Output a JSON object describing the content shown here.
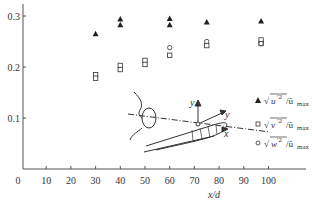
{
  "chart_data": {
    "type": "scatter",
    "title": "",
    "xlabel": "x/d",
    "ylabel": "",
    "xlim": [
      0,
      110
    ],
    "ylim": [
      0,
      0.32
    ],
    "grid": false,
    "legend_position": "right-inside",
    "x_ticks": [
      "0",
      "10",
      "20",
      "30",
      "40",
      "50",
      "60",
      "70",
      "80",
      "90",
      "100"
    ],
    "y_ticks": [
      "0.1",
      "0.2",
      "0.3"
    ],
    "series": [
      {
        "name": "sqrt(u'^2)/u_max",
        "marker": "filled-triangle",
        "points": [
          {
            "x": 30,
            "y": 0.265
          },
          {
            "x": 40,
            "y": 0.294
          },
          {
            "x": 40,
            "y": 0.283
          },
          {
            "x": 60,
            "y": 0.295
          },
          {
            "x": 60,
            "y": 0.283
          },
          {
            "x": 75,
            "y": 0.288
          },
          {
            "x": 97,
            "y": 0.29
          }
        ]
      },
      {
        "name": "sqrt(v'^2)/u_max",
        "marker": "open-square",
        "points": [
          {
            "x": 30,
            "y": 0.185
          },
          {
            "x": 30,
            "y": 0.178
          },
          {
            "x": 40,
            "y": 0.203
          },
          {
            "x": 40,
            "y": 0.195
          },
          {
            "x": 50,
            "y": 0.213
          },
          {
            "x": 50,
            "y": 0.205
          },
          {
            "x": 60,
            "y": 0.223
          },
          {
            "x": 75,
            "y": 0.242
          },
          {
            "x": 97,
            "y": 0.253
          },
          {
            "x": 97,
            "y": 0.246
          }
        ]
      },
      {
        "name": "sqrt(w'^2)/u_max",
        "marker": "open-circle",
        "points": [
          {
            "x": 60,
            "y": 0.238
          },
          {
            "x": 75,
            "y": 0.25
          },
          {
            "x": 97,
            "y": 0.246
          }
        ]
      }
    ],
    "annotations": [
      "inset diagram: jet nozzle with coordinate axes x, y, and velocity profile"
    ]
  },
  "axes": {
    "origin_label": "0",
    "x_tick_labels": [
      "10",
      "20",
      "30",
      "40",
      "50",
      "60",
      "70",
      "80",
      "90",
      "100"
    ],
    "y_tick_labels": [
      "0.1",
      "0.2",
      "0.3"
    ],
    "x_title": "x/d"
  },
  "legend": {
    "items": [
      {
        "symbol": "▲",
        "var": "u",
        "label_suffix": "/ū",
        "sub": "max"
      },
      {
        "symbol": "□",
        "var": "v",
        "label_suffix": "/ū",
        "sub": "max"
      },
      {
        "symbol": "○",
        "var": "w",
        "label_suffix": "/ū",
        "sub": "max"
      }
    ]
  },
  "inset": {
    "axis_y_label": "y",
    "axis_y2_label": "y",
    "axis_x_label": "x"
  }
}
